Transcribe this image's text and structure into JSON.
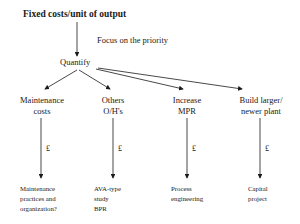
{
  "diagram": {
    "title": "Fixed costs/unit of output",
    "annotation": "Focus on the priority",
    "hub": "Quantify",
    "branches": [
      {
        "label_line1": "Maintenance",
        "label_line2": "costs",
        "arrow_label": "£",
        "outcome": [
          "Maintenance",
          "practices and",
          "organization?"
        ]
      },
      {
        "label_line1": "Others",
        "label_line2": "O/H's",
        "arrow_label": "£",
        "outcome": [
          "AVA-type",
          "study",
          "BPR"
        ]
      },
      {
        "label_line1": "Increase",
        "label_line2": "MPR",
        "arrow_label": "£",
        "outcome": [
          "Process",
          "engineering"
        ]
      },
      {
        "label_line1": "Build larger/",
        "label_line2": "newer plant",
        "arrow_label": "£",
        "outcome": [
          "Capital",
          "project"
        ]
      }
    ]
  }
}
